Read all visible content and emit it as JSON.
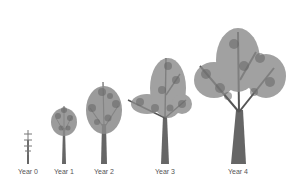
{
  "figure": {
    "type": "tree growth stages illustration",
    "stages": [
      {
        "label": "Year 0",
        "x": 28,
        "height": 36,
        "trunk_width": 2,
        "crown_width": 8
      },
      {
        "label": "Year 1",
        "x": 64,
        "height": 60,
        "trunk_width": 4,
        "crown_width": 26
      },
      {
        "label": "Year 2",
        "x": 104,
        "height": 84,
        "trunk_width": 6,
        "crown_width": 38
      },
      {
        "label": "Year 3",
        "x": 165,
        "height": 112,
        "trunk_width": 8,
        "crown_width": 62
      },
      {
        "label": "Year 4",
        "x": 238,
        "height": 136,
        "trunk_width": 14,
        "crown_width": 92
      }
    ],
    "colors": {
      "trunk": "#666666",
      "foliage": "#8a8a8a",
      "foliage_dark": "#555555",
      "label": "#555555",
      "background": "#ffffff"
    }
  }
}
